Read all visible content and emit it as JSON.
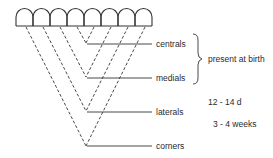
{
  "diagram": {
    "type": "incisor eruption sequence",
    "arch_count": 8,
    "teeth": [
      {
        "name": "centrals"
      },
      {
        "name": "medials"
      },
      {
        "name": "laterals"
      },
      {
        "name": "corners"
      }
    ],
    "bracket_label": "present at birth",
    "timings": [
      {
        "label": "12 - 14 d"
      },
      {
        "label": "3 - 4 weeks"
      }
    ],
    "colors": {
      "line": "#333333",
      "background": "#ffffff"
    }
  }
}
